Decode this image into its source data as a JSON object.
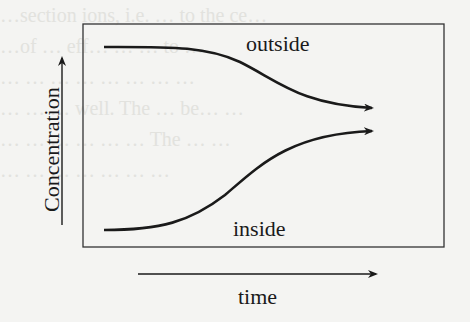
{
  "diagram": {
    "title": "",
    "y_axis_label": "Concentration",
    "x_axis_label": "time",
    "curves": [
      {
        "name": "outside",
        "label": "outside",
        "trend": "decreasing sigmoid toward equilibrium"
      },
      {
        "name": "inside",
        "label": "inside",
        "trend": "increasing sigmoid toward equilibrium"
      }
    ],
    "colors": {
      "line": "#1a1a1a",
      "background": "#f4f4f2"
    }
  },
  "background_text": {
    "faint_lines": [
      "…section ions, i.e. … to the ce…",
      "…of … eff… … … to …",
      "… … … … … … … …",
      "… … … well. The … be… …",
      "… … … … … … The … …",
      "… … … … … … …"
    ]
  }
}
